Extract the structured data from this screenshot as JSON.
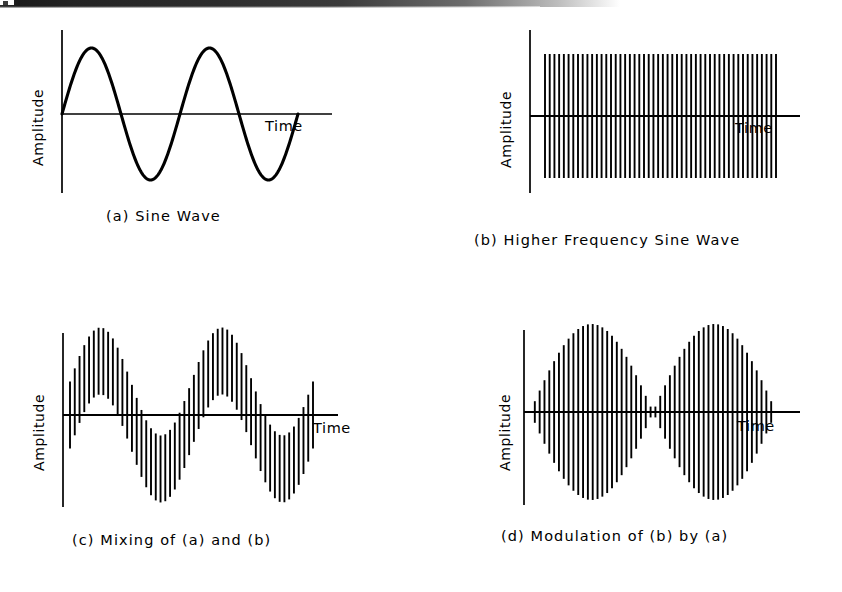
{
  "figure": {
    "background_color": "#ffffff",
    "ink_color": "#000000",
    "axis_label_y": "Amplitude",
    "axis_label_x": "Time"
  },
  "panels": [
    {
      "id": "a",
      "caption": "(a) Sine Wave",
      "axis_label_y": "Amplitude",
      "axis_label_x": "Time",
      "render": "curve"
    },
    {
      "id": "b",
      "caption": "(b) Higher Frequency Sine Wave",
      "axis_label_y": "Amplitude",
      "axis_label_x": "Time",
      "render": "bars"
    },
    {
      "id": "c",
      "caption": "(c) Mixing of (a) and (b)",
      "axis_label_y": "Amplitude",
      "axis_label_x": "Time",
      "render": "bars"
    },
    {
      "id": "d",
      "caption": "(d) Modulation of (b) by (a)",
      "axis_label_y": "Amplitude",
      "axis_label_x": "Time",
      "render": "bars"
    }
  ],
  "chart_data": [
    {
      "type": "line",
      "panel": "a",
      "title": "(a) Sine Wave",
      "xlabel": "Time",
      "ylabel": "Amplitude",
      "description": "Low frequency sine wave, two complete cycles, drawn as a smooth continuous curve",
      "waveform": "sine",
      "cycles": 2,
      "amplitude": 1.0,
      "phase": 0,
      "samples": 400,
      "xlim": [
        0,
        2
      ],
      "ylim": [
        -1,
        1
      ],
      "grid": false,
      "legend": null,
      "geometry": {
        "axis_x": 62,
        "baseline_y": 114,
        "axis_top_y": 30,
        "axis_bottom_y": 193,
        "plot_left": 62,
        "plot_right": 298,
        "axis_right": 332,
        "pixel_amplitude": 66
      }
    },
    {
      "type": "bar",
      "panel": "b",
      "title": "(b) Higher Frequency Sine Wave",
      "xlabel": "Time",
      "ylabel": "Amplitude",
      "description": "High frequency sine wave rendered as dense vertical strokes of constant amplitude",
      "waveform": "carrier",
      "carrier_cycles": 50,
      "envelope": "constant",
      "envelope_amplitude": 1.0,
      "n_bars": 50,
      "xlim": [
        0,
        1
      ],
      "ylim": [
        -1,
        1
      ],
      "grid": false,
      "legend": null,
      "geometry": {
        "axis_x": 530,
        "baseline_y": 116,
        "axis_top_y": 30,
        "axis_bottom_y": 193,
        "plot_left": 545,
        "plot_right": 776,
        "axis_right": 800,
        "pixel_amplitude": 62
      }
    },
    {
      "type": "bar",
      "panel": "c",
      "title": "(c) Mixing of (a) and (b)",
      "xlabel": "Time",
      "ylabel": "Amplitude",
      "description": "Additive mixing: slow sine offset added to constant-amplitude carrier; each stroke spans sine-1 to sine+1 so the stroke band rides up and down with the low frequency sine",
      "waveform": "sum",
      "mode": "additive",
      "modulator_cycles": 2,
      "modulator_amplitude": 1.0,
      "carrier_amplitude": 0.62,
      "n_bars": 52,
      "xlim": [
        0,
        2
      ],
      "ylim": [
        -1.62,
        1.62
      ],
      "grid": false,
      "legend": null,
      "geometry": {
        "axis_x": 63,
        "baseline_y": 415,
        "axis_top_y": 333,
        "axis_bottom_y": 507,
        "plot_left": 70,
        "plot_right": 313,
        "axis_right": 338,
        "pixel_amplitude": 54
      }
    },
    {
      "type": "bar",
      "panel": "d",
      "title": "(d) Modulation of (b) by (a)",
      "xlabel": "Time",
      "ylabel": "Amplitude",
      "description": "Amplitude modulation: carrier amplitude scaled by the absolute value of the slow sine, producing two symmetric lobes with a null at the centre",
      "waveform": "product",
      "mode": "amplitude-modulation",
      "modulator_cycles": 2,
      "modulator_amplitude": 1.0,
      "carrier_amplitude": 1.0,
      "n_bars": 52,
      "xlim": [
        0,
        2
      ],
      "ylim": [
        -1,
        1
      ],
      "grid": false,
      "legend": null,
      "geometry": {
        "axis_x": 524,
        "baseline_y": 412,
        "axis_top_y": 330,
        "axis_bottom_y": 505,
        "plot_left": 530,
        "plot_right": 776,
        "axis_right": 800,
        "pixel_amplitude": 88
      }
    }
  ]
}
